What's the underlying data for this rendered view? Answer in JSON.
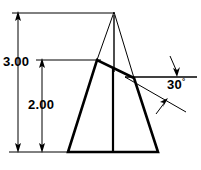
{
  "drawing": {
    "title": "Dimensioned wedge / truncated triangular prism elevation",
    "background_color": "#ffffff",
    "line_color": "#000000",
    "dimensions": [
      {
        "id": "overall-height",
        "label": "3.00",
        "orientation": "vertical",
        "description": "Overall height from base to apex of construction triangle"
      },
      {
        "id": "shoulder-height",
        "label": "2.00",
        "orientation": "vertical",
        "description": "Height from base to left peak of solid outline"
      },
      {
        "id": "slant-angle",
        "label": "30",
        "degree_symbol": "°",
        "orientation": "angular",
        "description": "Angle of slanted top face below horizontal reference line"
      }
    ],
    "geometry": {
      "solid_outline": {
        "type": "polygon",
        "stroke_width": 2.6,
        "points": "68,152 97,60 134,78 158,152"
      },
      "center_line": {
        "type": "line",
        "stroke_width": 2.2,
        "x1": 113,
        "y1": 70,
        "x2": 113,
        "y2": 152
      },
      "construction_triangle": {
        "type": "polyline",
        "stroke_width": 1,
        "points": "97,60 114,12 134,78"
      },
      "construction_center_line": {
        "type": "line",
        "stroke_width": 1,
        "x1": 114,
        "y1": 14,
        "x2": 114,
        "y2": 72
      },
      "baseline_extension": {
        "type": "line",
        "stroke_width": 1,
        "x1": 10,
        "y1": 152,
        "x2": 72,
        "y2": 152
      },
      "top_extension_line": {
        "type": "line",
        "stroke_width": 1,
        "x1": 12,
        "y1": 13,
        "x2": 114,
        "y2": 13
      },
      "shoulder_extension_line": {
        "type": "line",
        "stroke_width": 1,
        "x1": 36,
        "y1": 60,
        "x2": 100,
        "y2": 60
      },
      "angle_reference_line": {
        "type": "line",
        "stroke_width": 1.6,
        "x1": 126,
        "y1": 77,
        "x2": 197,
        "y2": 77
      },
      "angle_slant_line": {
        "type": "line",
        "stroke_width": 1,
        "x1": 126,
        "y1": 77,
        "x2": 186,
        "y2": 112
      },
      "dimension_line_3": {
        "type": "line",
        "stroke_width": 1,
        "x1": 18,
        "y1": 14,
        "x2": 18,
        "y2": 151
      },
      "dimension_line_2": {
        "type": "line",
        "stroke_width": 1,
        "x1": 42,
        "y1": 61,
        "x2": 42,
        "y2": 151
      },
      "angle_leader_upper": {
        "type": "line",
        "stroke_width": 1,
        "x1": 171,
        "y1": 57,
        "x2": 177,
        "y2": 73
      },
      "angle_leader_lower": {
        "type": "line",
        "stroke_width": 1,
        "x1": 157,
        "y1": 113,
        "x2": 166,
        "y2": 101
      }
    },
    "arrowheads": [
      {
        "id": "arrow-3-top",
        "x": 18,
        "y": 13,
        "direction": "up"
      },
      {
        "id": "arrow-3-bottom",
        "x": 18,
        "y": 152,
        "direction": "down"
      },
      {
        "id": "arrow-2-top",
        "x": 42,
        "y": 60,
        "direction": "up"
      },
      {
        "id": "arrow-2-bottom",
        "x": 42,
        "y": 152,
        "direction": "down"
      },
      {
        "id": "arrow-angle-upper",
        "x": 177,
        "y": 76,
        "direction": "down"
      },
      {
        "id": "arrow-angle-lower",
        "x": 166,
        "y": 100,
        "direction": "up-right"
      }
    ]
  }
}
